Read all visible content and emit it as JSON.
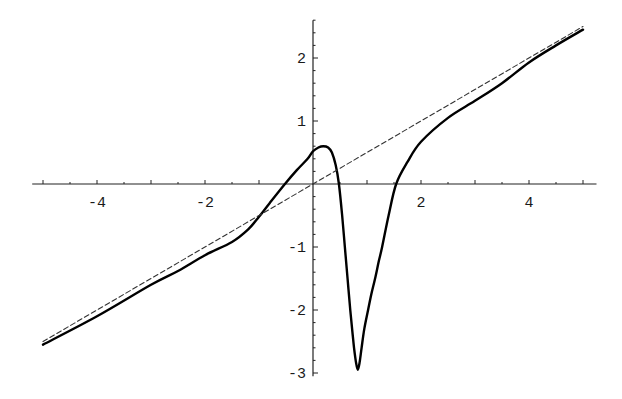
{
  "chart_data": {
    "type": "line",
    "title": "",
    "xlabel": "",
    "ylabel": "",
    "xlim": [
      -5.2,
      5.25
    ],
    "ylim": [
      -3.05,
      2.6
    ],
    "grid": false,
    "legend": null,
    "x_ticks": [
      -4,
      -2,
      2,
      4
    ],
    "x_tick_labels": [
      "-4",
      "-2",
      "2",
      "4"
    ],
    "y_ticks": [
      -3,
      -2,
      -1,
      1,
      2
    ],
    "y_tick_labels": [
      "-3",
      "-2",
      "-1",
      "1",
      "2"
    ],
    "x_minor_step": 0.5,
    "y_minor_step": 0.2,
    "series": [
      {
        "name": "curve",
        "style": "solid",
        "color": "#000000",
        "x": [
          -5,
          -4,
          -3,
          -2.5,
          -2,
          -1.5,
          -1.2,
          -1.0,
          -0.8,
          -0.52,
          -0.3,
          -0.1,
          0,
          0.1,
          0.19,
          0.28,
          0.35,
          0.42,
          0.48,
          0.54,
          0.59,
          0.64,
          0.69,
          0.73,
          0.76,
          0.8,
          0.83,
          0.86,
          0.9,
          0.95,
          1.02,
          1.08,
          1.15,
          1.22,
          1.28,
          1.4,
          1.54,
          1.75,
          2,
          2.5,
          3,
          3.5,
          4,
          4.5,
          5
        ],
        "values": [
          -2.55,
          -2.1,
          -1.6,
          -1.38,
          -1.13,
          -0.92,
          -0.72,
          -0.52,
          -0.3,
          0,
          0.22,
          0.4,
          0.52,
          0.58,
          0.6,
          0.58,
          0.5,
          0.3,
          0,
          -0.5,
          -1.0,
          -1.5,
          -2.0,
          -2.35,
          -2.6,
          -2.85,
          -2.95,
          -2.85,
          -2.6,
          -2.3,
          -2.0,
          -1.75,
          -1.5,
          -1.22,
          -1.0,
          -0.5,
          0,
          0.35,
          0.67,
          1.05,
          1.32,
          1.6,
          1.93,
          2.2,
          2.45
        ]
      },
      {
        "name": "asymptote y = x/2",
        "style": "dashed",
        "color": "#333333",
        "x": [
          -5,
          5
        ],
        "values": [
          -2.5,
          2.5
        ]
      }
    ]
  }
}
